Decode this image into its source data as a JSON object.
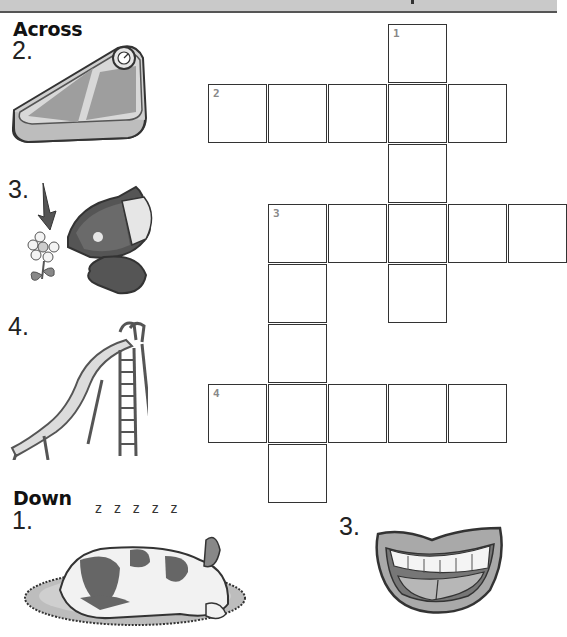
{
  "page": {
    "headings": {
      "across": "Across",
      "down": "Down"
    }
  },
  "clues": {
    "across": [
      {
        "number": "2.",
        "picture": "bathroom-scale",
        "answer_length": 5
      },
      {
        "number": "3.",
        "picture": "cat-smelling-flower",
        "answer_length": 5
      },
      {
        "number": "4.",
        "picture": "playground-slide",
        "answer_length": 5
      }
    ],
    "down": [
      {
        "number": "1.",
        "picture": "sleeping-dog",
        "sleep_text": "z z z z z",
        "answer_length": 5
      },
      {
        "number": "3.",
        "picture": "smiling-mouth",
        "answer_length": 5
      }
    ]
  },
  "grid": {
    "cell_size": 60,
    "origin_x": 208,
    "origin_y": 24,
    "numbers": [
      {
        "label": "1",
        "row": 0,
        "col": 3
      },
      {
        "label": "2",
        "row": 1,
        "col": 0
      },
      {
        "label": "3",
        "row": 3,
        "col": 1
      },
      {
        "label": "4",
        "row": 6,
        "col": 0
      }
    ],
    "cells": [
      [
        0,
        3
      ],
      [
        1,
        0
      ],
      [
        1,
        1
      ],
      [
        1,
        2
      ],
      [
        1,
        3
      ],
      [
        1,
        4
      ],
      [
        2,
        3
      ],
      [
        3,
        1
      ],
      [
        3,
        2
      ],
      [
        3,
        3
      ],
      [
        3,
        4
      ],
      [
        3,
        5
      ],
      [
        4,
        1
      ],
      [
        4,
        3
      ],
      [
        5,
        1
      ],
      [
        6,
        0
      ],
      [
        6,
        1
      ],
      [
        6,
        2
      ],
      [
        6,
        3
      ],
      [
        6,
        4
      ],
      [
        7,
        1
      ]
    ]
  },
  "colors": {
    "grid_line": "#333333",
    "clue_number_gray": "#888888",
    "top_bar": "#c9c9c9"
  }
}
